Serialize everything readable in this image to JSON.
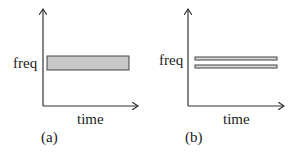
{
  "panels": [
    {
      "id": "a",
      "caption": "(a)",
      "y_label": "freq",
      "x_label": "time",
      "description": "single wide frequency band spanning time",
      "bands": [
        {
          "fill": "#c8c8c8"
        }
      ]
    },
    {
      "id": "b",
      "caption": "(b)",
      "y_label": "freq",
      "x_label": "time",
      "description": "two narrow frequency bands spanning time",
      "bands": [
        {
          "fill": "#d8d8d8"
        },
        {
          "fill": "#d8d8d8"
        }
      ]
    }
  ],
  "colors": {
    "axis": "#333333",
    "band_stroke": "#444444"
  }
}
